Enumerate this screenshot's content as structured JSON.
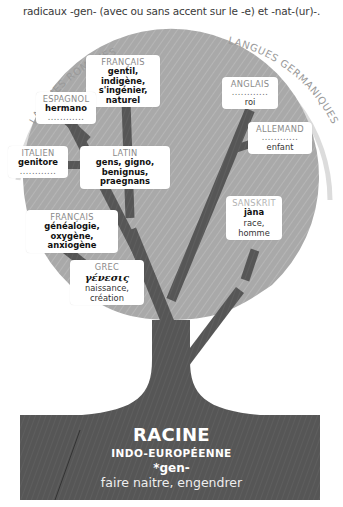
{
  "intro": {
    "text": "radicaux -gen- (avec ou sans accent sur le -e) et -nat-(ur)-."
  },
  "arcs": {
    "left_label": "LANGUES ROMANES",
    "right_label": "LANGUES GERMANIQUES"
  },
  "colors": {
    "crown": "#aaaaaa",
    "trunk": "#555555",
    "branch": "#666666",
    "arc": "#dddddd",
    "label_bg": "#ffffff"
  },
  "labels": {
    "francais_top": {
      "lang": "FRANÇAIS",
      "words": [
        "gentil, indigène,",
        "s'ingénier, naturel"
      ]
    },
    "espagnol": {
      "lang": "ESPAGNOL",
      "words": [
        "hermano"
      ],
      "dots": "............"
    },
    "italien": {
      "lang": "ITALIEN",
      "words": [
        "genitore"
      ],
      "dots": "............"
    },
    "latin": {
      "lang": "LATIN",
      "words": [
        "gens, gigno,",
        "benignus, praegnans"
      ]
    },
    "francais_bottom": {
      "lang": "FRANÇAIS",
      "words": [
        "généalogie, oxygène,",
        "anxiogène"
      ]
    },
    "grec": {
      "lang": "GREC",
      "greek": "γένεσις",
      "meaning": "naissance, création"
    },
    "anglais": {
      "lang": "ANGLAIS",
      "dots": "............",
      "meaning": "roi"
    },
    "allemand": {
      "lang": "ALLEMAND",
      "dots": "............",
      "meaning": "enfant"
    },
    "sanskrit": {
      "lang": "SANSKRIT",
      "word": "jàna",
      "meaning": "race, homme"
    }
  },
  "root": {
    "title": "RACINE",
    "subtitle": "INDO-EUROPÉENNE",
    "form": "*gen-",
    "meaning": "faire naitre, engendrer"
  }
}
